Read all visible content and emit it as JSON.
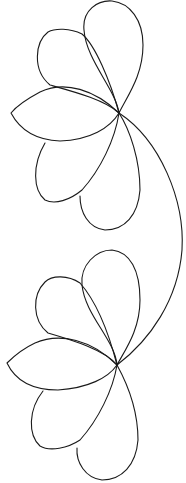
{
  "image": {
    "subject": "two half-flower line drawings connected by a curved stem",
    "stroke_color": "#1a1a1a",
    "background": "#ffffff",
    "flowers": [
      {
        "name": "top-flower",
        "petals": 5
      },
      {
        "name": "bottom-flower",
        "petals": 5
      }
    ]
  }
}
